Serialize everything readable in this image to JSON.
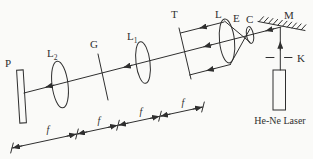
{
  "colors": {
    "paper": "#fafaf8",
    "ink": "#2f2f2f"
  },
  "labels": {
    "screen": "P",
    "lens2_main": "L",
    "lens2_sub": "2",
    "grating": "G",
    "lens1_main": "L",
    "lens1_sub": "1",
    "object": "T",
    "collimating_lens": "L",
    "pinhole": "E",
    "objective": "C",
    "mirror": "M",
    "aperture": "K",
    "laser": "He-Ne Laser"
  },
  "dimensions": {
    "f_labels": [
      "f",
      "f",
      "f",
      "f"
    ]
  }
}
